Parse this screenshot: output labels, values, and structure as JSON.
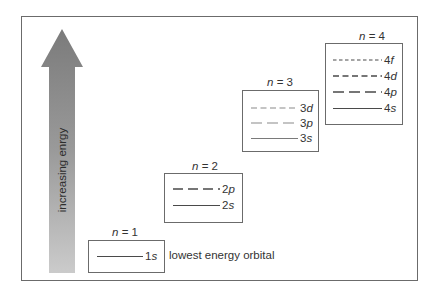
{
  "diagram": {
    "arrow": {
      "label": "increasing enrgy",
      "direction": "up",
      "color_top": "#7d7d7d",
      "color_bottom": "#c9c9c9"
    },
    "shells": [
      {
        "title_var": "n",
        "title_eq": " = 1",
        "orbitals": [
          {
            "num": "1",
            "letter": "s",
            "style": "solid"
          }
        ],
        "note": "lowest energy orbital"
      },
      {
        "title_var": "n",
        "title_eq": " = 2",
        "orbitals": [
          {
            "num": "2",
            "letter": "p",
            "style": "long-dash"
          },
          {
            "num": "2",
            "letter": "s",
            "style": "solid"
          }
        ]
      },
      {
        "title_var": "n",
        "title_eq": " = 3",
        "orbitals": [
          {
            "num": "3",
            "letter": "d",
            "style": "short-dash"
          },
          {
            "num": "3",
            "letter": "p",
            "style": "long-dash"
          },
          {
            "num": "3",
            "letter": "s",
            "style": "solid"
          }
        ]
      },
      {
        "title_var": "n",
        "title_eq": " = 4",
        "orbitals": [
          {
            "num": "4",
            "letter": "f",
            "style": "dotted-dash"
          },
          {
            "num": "4",
            "letter": "d",
            "style": "short-dash"
          },
          {
            "num": "4",
            "letter": "p",
            "style": "long-dash"
          },
          {
            "num": "4",
            "letter": "s",
            "style": "solid"
          }
        ]
      }
    ]
  }
}
